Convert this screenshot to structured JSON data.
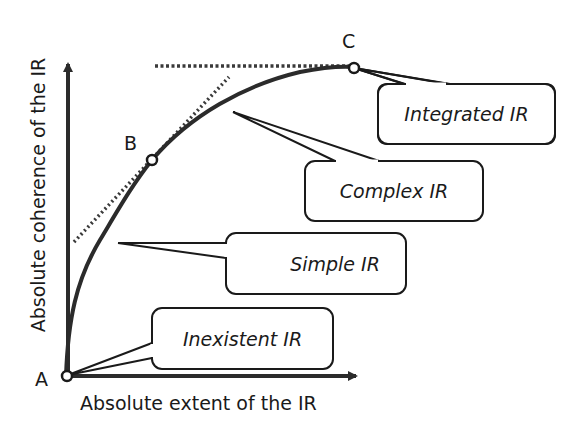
{
  "diagram": {
    "axes": {
      "x_label": "Absolute extent of the IR",
      "y_label": "Absolute coherence of the IR"
    },
    "points": [
      {
        "id": "A",
        "label": "A"
      },
      {
        "id": "B",
        "label": "B"
      },
      {
        "id": "C",
        "label": "C"
      }
    ],
    "callouts": [
      {
        "id": "integrated",
        "label": "Integrated IR"
      },
      {
        "id": "complex",
        "label": "Complex IR"
      },
      {
        "id": "simple",
        "label": "Simple IR"
      },
      {
        "id": "inexistent",
        "label": "Inexistent IR"
      }
    ],
    "colors": {
      "stroke": "#1a1a1a",
      "curve": "#2b2b2b",
      "background": "#ffffff"
    }
  }
}
